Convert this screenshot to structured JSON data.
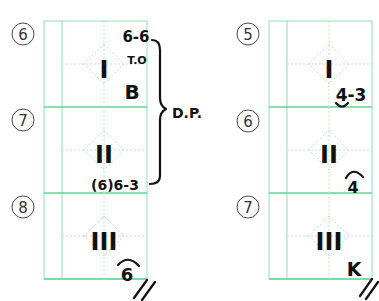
{
  "colors": {
    "grid": "#8fe0b4",
    "ink": "#111111"
  },
  "scorecards": [
    {
      "name": "left",
      "rows": [
        {
          "batter": "6",
          "inning_mark": "I",
          "notes": [
            "6-6",
            "T.O",
            "B"
          ]
        },
        {
          "batter": "7",
          "inning_mark": "II",
          "notes": [
            "(6)6-3"
          ]
        },
        {
          "batter": "8",
          "inning_mark": "III",
          "notes": [
            "6"
          ]
        }
      ],
      "bracket_label": "D.P.",
      "end_mark": "//"
    },
    {
      "name": "right",
      "rows": [
        {
          "batter": "5",
          "inning_mark": "I",
          "notes": [
            "4-3"
          ]
        },
        {
          "batter": "6",
          "inning_mark": "II",
          "notes": [
            "4"
          ]
        },
        {
          "batter": "7",
          "inning_mark": "III",
          "notes": [
            "K"
          ]
        }
      ],
      "end_mark": "//"
    }
  ]
}
